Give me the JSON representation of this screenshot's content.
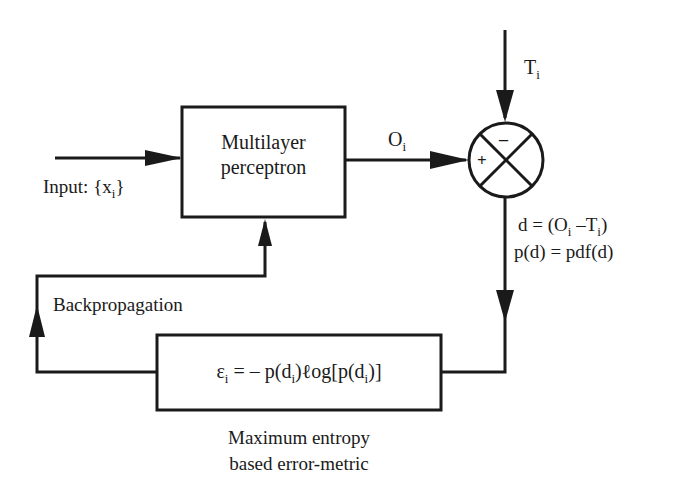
{
  "diagram": {
    "blocks": {
      "mlp": {
        "line1": "Multilayer",
        "line2": "perceptron"
      },
      "error_metric": {
        "eps": "ε",
        "sub_i": "i",
        "eq_part1": " = – p(d",
        "eq_part2": ")ℓog[p(d",
        "eq_part3": ")]",
        "caption_line1": "Maximum  entropy",
        "caption_line2": "based error-metric"
      },
      "summer": {
        "plus": "+",
        "minus": "–"
      }
    },
    "labels": {
      "input": {
        "text": "Input: {x",
        "sub": "i",
        "close": "}"
      },
      "output": {
        "text": "O",
        "sub": "i"
      },
      "target": {
        "text": "T",
        "sub": "i"
      },
      "d_eq": {
        "p1": "d = (O",
        "s1": "i",
        "p2": " –T",
        "s2": "i",
        "p3": ")"
      },
      "pdf_eq": "p(d) = pdf(d)",
      "backprop": "Backpropagation"
    },
    "colors": {
      "stroke": "#1a1a1a",
      "background": "#ffffff"
    }
  }
}
